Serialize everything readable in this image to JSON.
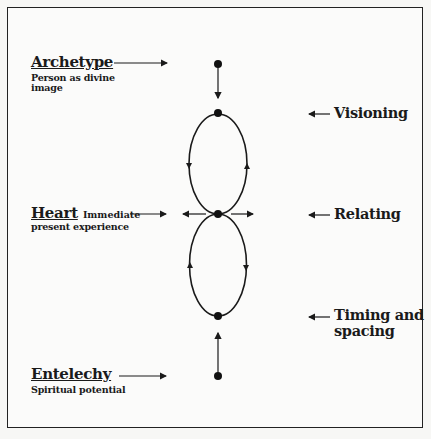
{
  "left_labels": {
    "archetype": {
      "title": "Archetype",
      "subtitle_line1": "Person as divine",
      "subtitle_line2": "image"
    },
    "heart": {
      "title": "Heart",
      "subtitle_line1": "Immediate",
      "subtitle_line2": "present experience"
    },
    "entelechy": {
      "title": "Entelechy",
      "subtitle_line1": "Spiritual potential"
    }
  },
  "right_labels": {
    "visioning": "Visioning",
    "relating": "Relating",
    "timing_line1": "Timing and",
    "timing_line2": "spacing"
  },
  "diagram": {
    "shape": "figure-eight of two vertical ellipses joined at center node",
    "nodes": [
      "top-external",
      "upper-loop-top",
      "center",
      "lower-loop-bottom",
      "bottom-external"
    ],
    "line_color": "#1a1a1a"
  }
}
